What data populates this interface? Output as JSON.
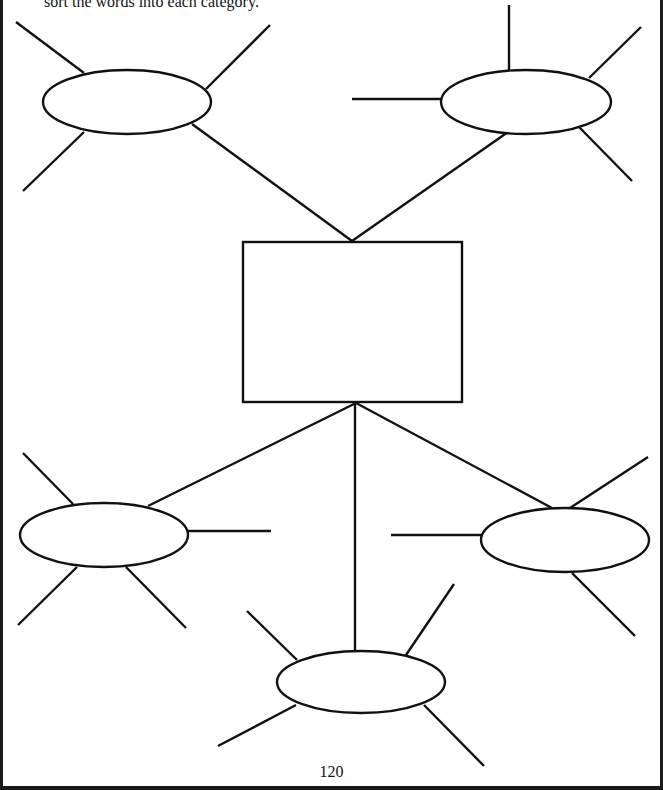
{
  "instruction_text": "sort the words into each category.",
  "page_number": "120",
  "colors": {
    "ink": "#111111",
    "paper": "#ffffff",
    "frame": "#1a1a1a"
  },
  "diagram": {
    "type": "word-sort web / graphic organizer",
    "center_box": {
      "label": "",
      "x": 243,
      "y": 242,
      "w": 219,
      "h": 160
    },
    "category_ellipses": [
      {
        "id": "top-left",
        "label": "",
        "cx": 127,
        "cy": 102,
        "rx": 84,
        "ry": 32,
        "spokes": 3
      },
      {
        "id": "top-right",
        "label": "",
        "cx": 526,
        "cy": 102,
        "rx": 85,
        "ry": 32,
        "spokes": 4
      },
      {
        "id": "bottom-left",
        "label": "",
        "cx": 104,
        "cy": 535,
        "rx": 84,
        "ry": 32,
        "spokes": 4
      },
      {
        "id": "bottom-center",
        "label": "",
        "cx": 361,
        "cy": 682,
        "rx": 84,
        "ry": 31,
        "spokes": 4
      },
      {
        "id": "bottom-right",
        "label": "",
        "cx": 565,
        "cy": 540,
        "rx": 84,
        "ry": 32,
        "spokes": 3
      }
    ]
  }
}
